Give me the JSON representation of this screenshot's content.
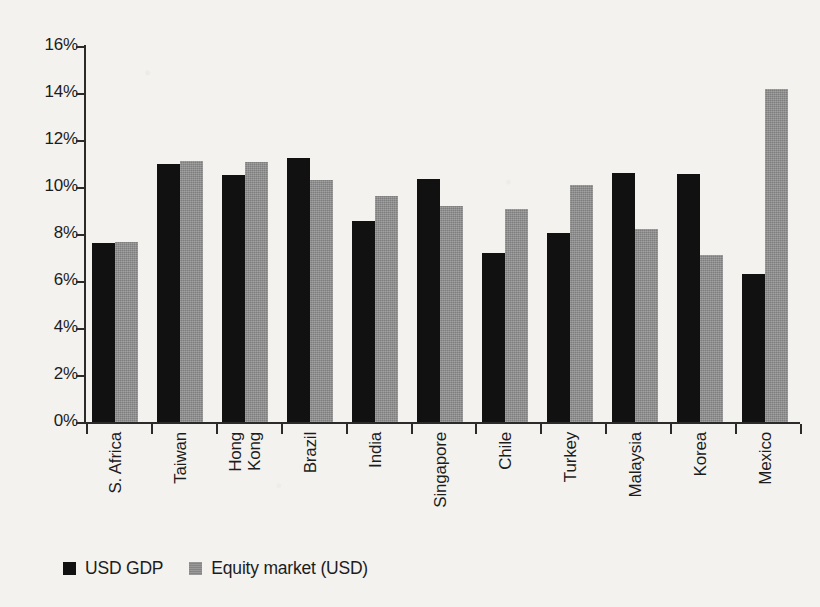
{
  "chart_data": {
    "type": "bar",
    "title": "",
    "subtitle": "",
    "xlabel": "",
    "ylabel": "",
    "ylim": [
      0,
      16
    ],
    "ytick_labels": [
      "0%",
      "2%",
      "4%",
      "6%",
      "8%",
      "10%",
      "12%",
      "14%",
      "16%"
    ],
    "ytick_values": [
      0,
      2,
      4,
      6,
      8,
      10,
      12,
      14,
      16
    ],
    "grid": false,
    "legend_position": "bottom-left",
    "value_unit": "%",
    "categories": [
      "S. Africa",
      "Taiwan",
      "Hong\nKong",
      "Brazil",
      "India",
      "Singapore",
      "Chile",
      "Turkey",
      "Malaysia",
      "Korea",
      "Mexico"
    ],
    "series": [
      {
        "name": "USD GDP",
        "color": "#111111",
        "values": [
          7.6,
          11.0,
          10.5,
          11.25,
          8.55,
          10.35,
          7.2,
          8.05,
          10.6,
          10.55,
          6.3
        ]
      },
      {
        "name": "Equity market (USD)",
        "color": "#8d8d8d",
        "values": [
          7.65,
          11.1,
          11.05,
          10.3,
          9.6,
          9.2,
          9.05,
          10.1,
          8.2,
          7.1,
          14.15
        ]
      }
    ]
  },
  "legend": {
    "items": [
      {
        "label": "USD GDP",
        "swatch": "black-square-icon"
      },
      {
        "label": "Equity market (USD)",
        "swatch": "gray-square-icon"
      }
    ]
  }
}
